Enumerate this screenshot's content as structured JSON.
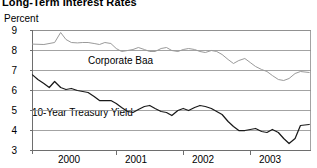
{
  "title": "Long-Term Interest Rates",
  "axis": {
    "ylabel": "Percent",
    "yticks": [
      "9",
      "8",
      "7",
      "6",
      "5",
      "4",
      "3"
    ],
    "xticks": [
      "2000",
      "2001",
      "2002",
      "2003"
    ]
  },
  "labels": {
    "baa": "Corporate Baa",
    "treasury": "10-Year Treasury Yield"
  },
  "colors": {
    "baa": "#9a9a9a",
    "treasury": "#1a1a1a",
    "grid": "#8c8c8c",
    "axis": "#6e6e6e",
    "background": "#ffffff"
  },
  "chart_data": {
    "type": "line",
    "title": "Long-Term Interest Rates",
    "xlabel": "",
    "ylabel": "Percent",
    "ylim": [
      3,
      9
    ],
    "xlim": [
      1999.75,
      2003.9
    ],
    "grid": true,
    "legend": "inline-annotations",
    "yticks": [
      3,
      4,
      5,
      6,
      7,
      8,
      9
    ],
    "xticks": [
      2000,
      2001,
      2002,
      2003
    ],
    "xtick_positions": [
      2000.42,
      2001.42,
      2002.42,
      2003.42
    ],
    "series": [
      {
        "name": "Corporate Baa",
        "color": "#9a9a9a",
        "x": [
          1999.75,
          1999.92,
          2000.08,
          2000.17,
          2000.25,
          2000.33,
          2000.42,
          2000.5,
          2000.58,
          2000.67,
          2000.75,
          2000.83,
          2000.92,
          2001.0,
          2001.08,
          2001.17,
          2001.25,
          2001.33,
          2001.42,
          2001.5,
          2001.58,
          2001.67,
          2001.75,
          2001.83,
          2001.92,
          2002.0,
          2002.08,
          2002.17,
          2002.25,
          2002.33,
          2002.42,
          2002.5,
          2002.58,
          2002.67,
          2002.75,
          2002.83,
          2002.92,
          2003.0,
          2003.08,
          2003.17,
          2003.25,
          2003.33,
          2003.42,
          2003.5,
          2003.58,
          2003.67,
          2003.75,
          2003.88
        ],
        "y": [
          8.32,
          8.3,
          8.4,
          8.9,
          8.55,
          8.4,
          8.38,
          8.4,
          8.4,
          8.35,
          8.3,
          8.4,
          8.35,
          8.1,
          7.95,
          8.0,
          8.05,
          8.15,
          8.05,
          7.95,
          7.95,
          8.1,
          8.15,
          8.0,
          7.95,
          8.05,
          8.1,
          8.05,
          7.95,
          7.9,
          8.0,
          7.95,
          7.8,
          7.55,
          7.35,
          7.5,
          7.6,
          7.4,
          7.2,
          7.05,
          6.95,
          6.75,
          6.55,
          6.5,
          6.6,
          6.85,
          6.95,
          6.9
        ],
        "y_range_note": "Baa corporate bond yield, percent"
      },
      {
        "name": "10-Year Treasury Yield",
        "color": "#1a1a1a",
        "x": [
          1999.75,
          1999.83,
          1999.92,
          2000.0,
          2000.08,
          2000.17,
          2000.25,
          2000.33,
          2000.42,
          2000.5,
          2000.58,
          2000.67,
          2000.75,
          2000.83,
          2000.92,
          2001.0,
          2001.08,
          2001.17,
          2001.25,
          2001.33,
          2001.42,
          2001.5,
          2001.58,
          2001.67,
          2001.75,
          2001.83,
          2001.92,
          2002.0,
          2002.08,
          2002.17,
          2002.25,
          2002.33,
          2002.42,
          2002.5,
          2002.58,
          2002.67,
          2002.75,
          2002.83,
          2002.92,
          2003.0,
          2003.08,
          2003.17,
          2003.25,
          2003.33,
          2003.42,
          2003.5,
          2003.58,
          2003.67,
          2003.75,
          2003.88
        ],
        "y": [
          6.78,
          6.55,
          6.35,
          6.15,
          6.45,
          6.15,
          6.05,
          6.1,
          6.0,
          5.95,
          5.9,
          5.7,
          5.5,
          5.5,
          5.5,
          5.35,
          5.15,
          4.95,
          4.9,
          5.05,
          5.2,
          5.25,
          5.1,
          4.95,
          4.9,
          4.75,
          5.0,
          5.1,
          5.0,
          5.15,
          5.25,
          5.2,
          5.1,
          4.95,
          4.8,
          4.45,
          4.2,
          4.0,
          4.0,
          4.05,
          4.1,
          3.95,
          3.9,
          4.05,
          3.9,
          3.6,
          3.35,
          3.6,
          4.25,
          4.3
        ],
        "y_range_note": "10-year Treasury constant maturity yield, percent"
      }
    ]
  }
}
